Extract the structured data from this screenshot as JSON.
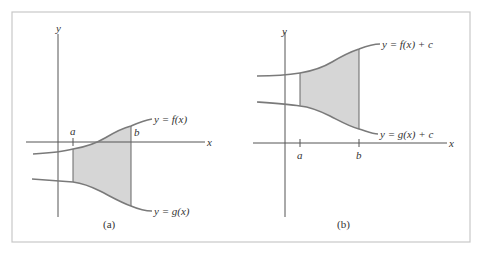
{
  "figure": {
    "frame_color": "#c8c8c8",
    "axis_color": "#555555",
    "curve_color": "#7a7a7a",
    "fill_color": "#d6d6d6"
  },
  "panels": [
    {
      "caption": "(a)",
      "y_axis_label": "y",
      "x_axis_label": "x",
      "tick_a": "a",
      "tick_b": "b",
      "upper_curve_label": "y = f(x)",
      "lower_curve_label": "y = g(x)"
    },
    {
      "caption": "(b)",
      "y_axis_label": "y",
      "x_axis_label": "x",
      "tick_a": "a",
      "tick_b": "b",
      "upper_curve_label": "y = f(x) + c",
      "lower_curve_label": "y = g(x) + c"
    }
  ]
}
